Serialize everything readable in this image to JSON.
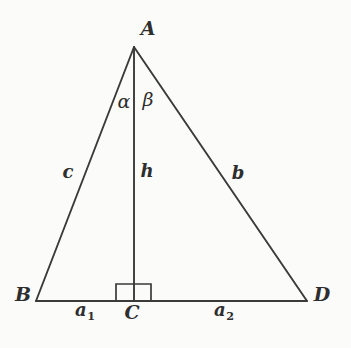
{
  "figure": {
    "type": "geometry-diagram",
    "background_color": "#fbfbfa",
    "stroke_color": "#3a3a3a",
    "label_color": "#2e2e2e"
  },
  "vertices": {
    "apex": {
      "label": "A",
      "x": 134,
      "y": 47,
      "label_x": 148,
      "label_y": 28
    },
    "left": {
      "label": "B",
      "x": 36,
      "y": 301,
      "label_x": 23,
      "label_y": 294
    },
    "foot": {
      "label": "C",
      "x": 134,
      "y": 301,
      "label_x": 132,
      "label_y": 312
    },
    "right": {
      "label": "D",
      "x": 307,
      "y": 301,
      "label_x": 322,
      "label_y": 294
    }
  },
  "sides": {
    "left_side": {
      "label": "c",
      "label_x": 68,
      "label_y": 172
    },
    "altitude": {
      "label": "h",
      "label_x": 147,
      "label_y": 171
    },
    "right_side": {
      "label": "b",
      "label_x": 238,
      "label_y": 173
    }
  },
  "angles": {
    "left_angle": {
      "label": "α",
      "label_x": 124,
      "label_y": 101
    },
    "right_angle": {
      "label": "β",
      "label_x": 148,
      "label_y": 99
    }
  },
  "segments": {
    "left_base": {
      "base": "a",
      "subscript": "1",
      "label_x": 85,
      "label_y": 311
    },
    "right_base": {
      "base": "a",
      "subscript": "2",
      "label_x": 224,
      "label_y": 311
    }
  },
  "right_angle_marker": {
    "name": "right-angle-square",
    "x": 116,
    "y": 284,
    "width": 35,
    "height": 17
  }
}
